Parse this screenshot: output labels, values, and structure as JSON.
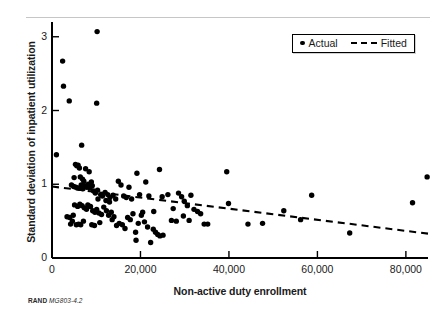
{
  "figure": {
    "source_note_brand": "RAND",
    "source_note_code": "MG803-4.2"
  },
  "legend": {
    "position": "top-right",
    "entries": [
      {
        "label": "Actual",
        "marker": "dot",
        "color": "#000000"
      },
      {
        "label": "Fitted",
        "marker": "dashed-line",
        "color": "#000000"
      }
    ]
  },
  "chart_data": {
    "type": "scatter",
    "title": "",
    "subtitle": "",
    "xlabel": "Non-active duty enrollment",
    "ylabel": "Standard deviation of inpatient utilization",
    "xlim": [
      0,
      85000
    ],
    "ylim": [
      0,
      3.2
    ],
    "xticks": [
      0,
      20000,
      40000,
      60000,
      80000
    ],
    "xticklabels": [
      "0",
      "20,000",
      "40,000",
      "60,000",
      "80,000"
    ],
    "yticks": [
      0,
      1,
      2,
      3
    ],
    "yticklabels": [
      "0",
      "1",
      "2",
      "3"
    ],
    "grid": false,
    "legend_position": "upper right",
    "series": [
      {
        "name": "Actual",
        "type": "scatter",
        "marker": "circle",
        "color": "#000000",
        "points": [
          [
            1000,
            1.4
          ],
          [
            2400,
            2.67
          ],
          [
            2600,
            2.33
          ],
          [
            3900,
            2.13
          ],
          [
            10200,
            3.07
          ],
          [
            10100,
            2.1
          ],
          [
            6700,
            1.53
          ],
          [
            5300,
            1.27
          ],
          [
            5600,
            1.25
          ],
          [
            5900,
            1.26
          ],
          [
            6200,
            1.22
          ],
          [
            7600,
            1.21
          ],
          [
            8400,
            1.17
          ],
          [
            6400,
            1.1
          ],
          [
            6900,
            1.07
          ],
          [
            7200,
            1.04
          ],
          [
            5000,
            1.09
          ],
          [
            4400,
            0.99
          ],
          [
            4900,
            0.97
          ],
          [
            5400,
            0.96
          ],
          [
            6100,
            0.95
          ],
          [
            6600,
            0.99
          ],
          [
            7000,
            0.94
          ],
          [
            7400,
            0.98
          ],
          [
            7900,
            0.96
          ],
          [
            8200,
            1.0
          ],
          [
            8600,
            0.95
          ],
          [
            9100,
            0.98
          ],
          [
            9400,
            0.91
          ],
          [
            9800,
            0.88
          ],
          [
            10300,
            0.92
          ],
          [
            11000,
            0.86
          ],
          [
            11400,
            0.84
          ],
          [
            12000,
            0.89
          ],
          [
            12600,
            0.86
          ],
          [
            13100,
            0.82
          ],
          [
            13800,
            0.85
          ],
          [
            14400,
            0.8
          ],
          [
            15000,
            1.04
          ],
          [
            15600,
            0.99
          ],
          [
            16200,
            0.84
          ],
          [
            16800,
            0.82
          ],
          [
            17400,
            0.96
          ],
          [
            18000,
            0.8
          ],
          [
            19200,
            1.15
          ],
          [
            19800,
            0.86
          ],
          [
            21200,
            1.03
          ],
          [
            21900,
            0.84
          ],
          [
            24300,
            1.2
          ],
          [
            24900,
            0.83
          ],
          [
            26200,
            0.86
          ],
          [
            27400,
            0.67
          ],
          [
            28600,
            0.88
          ],
          [
            29300,
            0.83
          ],
          [
            29900,
            0.77
          ],
          [
            30600,
            0.71
          ],
          [
            31400,
            0.85
          ],
          [
            32100,
            0.66
          ],
          [
            32900,
            0.63
          ],
          [
            33600,
            0.6
          ],
          [
            34400,
            0.46
          ],
          [
            35200,
            0.46
          ],
          [
            39500,
            1.17
          ],
          [
            39900,
            0.74
          ],
          [
            44300,
            0.46
          ],
          [
            47600,
            0.47
          ],
          [
            52400,
            0.64
          ],
          [
            56200,
            0.52
          ],
          [
            58700,
            0.85
          ],
          [
            67300,
            0.34
          ],
          [
            81500,
            0.75
          ],
          [
            84800,
            1.1
          ],
          [
            3400,
            0.56
          ],
          [
            4000,
            0.55
          ],
          [
            4600,
            0.5
          ],
          [
            5100,
            0.72
          ],
          [
            5800,
            0.7
          ],
          [
            6300,
            0.73
          ],
          [
            6800,
            0.71
          ],
          [
            7300,
            0.68
          ],
          [
            7800,
            0.66
          ],
          [
            8100,
            0.72
          ],
          [
            8700,
            0.7
          ],
          [
            9200,
            0.64
          ],
          [
            9700,
            0.62
          ],
          [
            10100,
            0.66
          ],
          [
            10600,
            0.61
          ],
          [
            11200,
            0.59
          ],
          [
            11700,
            0.69
          ],
          [
            12300,
            0.64
          ],
          [
            12800,
            0.58
          ],
          [
            13400,
            0.62
          ],
          [
            14000,
            0.56
          ],
          [
            14600,
            0.44
          ],
          [
            15200,
            0.47
          ],
          [
            15900,
            0.45
          ],
          [
            16500,
            0.4
          ],
          [
            17100,
            0.55
          ],
          [
            17700,
            0.52
          ],
          [
            18300,
            0.6
          ],
          [
            18900,
            0.35
          ],
          [
            19500,
            0.47
          ],
          [
            20200,
            0.58
          ],
          [
            20900,
            0.49
          ],
          [
            21600,
            0.42
          ],
          [
            22300,
            0.21
          ],
          [
            22900,
            0.39
          ],
          [
            23400,
            0.35
          ],
          [
            23900,
            0.32
          ],
          [
            24400,
            0.3
          ],
          [
            25100,
            0.31
          ],
          [
            4200,
            0.46
          ],
          [
            4800,
            0.58
          ],
          [
            5500,
            0.45
          ],
          [
            6000,
            0.46
          ],
          [
            6500,
            0.45
          ],
          [
            7100,
            0.5
          ],
          [
            9000,
            0.45
          ],
          [
            9600,
            0.44
          ],
          [
            10800,
            0.48
          ],
          [
            13600,
            0.52
          ],
          [
            19000,
            0.24
          ],
          [
            28100,
            0.5
          ],
          [
            29700,
            0.57
          ],
          [
            31000,
            0.51
          ],
          [
            27000,
            0.51
          ],
          [
            8900,
            1.03
          ],
          [
            12200,
            0.78
          ],
          [
            10400,
            0.8
          ],
          [
            13000,
            0.76
          ],
          [
            20500,
            0.62
          ],
          [
            23000,
            0.63
          ]
        ]
      },
      {
        "name": "Fitted",
        "type": "line",
        "style": "dashed",
        "color": "#000000",
        "endpoints": [
          [
            0,
            0.97
          ],
          [
            85000,
            0.33
          ]
        ]
      }
    ]
  }
}
